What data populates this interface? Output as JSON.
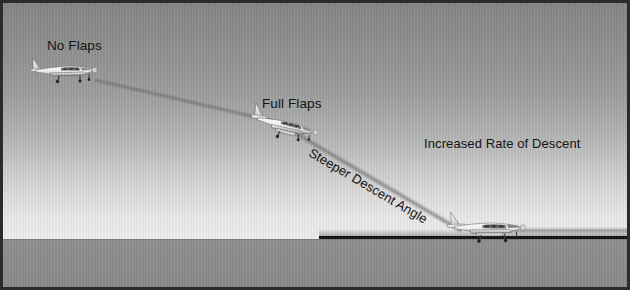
{
  "figure": {
    "kind": "aviation-diagram",
    "background": {
      "sky_top_color": "#868686",
      "sky_bottom_color": "#eeeeee",
      "ground_color": "#8e8e8e",
      "runway_line_color": "#14140f",
      "border_color": "#2b2b2b"
    }
  },
  "labels": {
    "no_flaps": "No Flaps",
    "full_flaps": "Full Flaps",
    "steeper_descent_angle": "Steeper Descent Angle",
    "increased_rate_of_descent": "Increased Rate of Descent"
  },
  "aircraft": [
    {
      "id": "no-flaps",
      "name": "airplane-no-flaps-icon",
      "x": 27,
      "y": 52,
      "attitude": "level",
      "label": "No Flaps"
    },
    {
      "id": "full-flaps",
      "name": "airplane-full-flaps-icon",
      "x": 248,
      "y": 104,
      "attitude": "nose-down-descending",
      "label": "Full Flaps"
    },
    {
      "id": "landing",
      "name": "airplane-landing-icon",
      "x": 444,
      "y": 206,
      "attitude": "touchdown",
      "label": ""
    }
  ],
  "paths": [
    {
      "id": "shallow-descent",
      "name": "shallow-descent-trail",
      "from": [
        92,
        74
      ],
      "to": [
        272,
        116
      ],
      "angle_deg": 13
    },
    {
      "id": "steep-descent",
      "name": "steep-descent-trail",
      "from": [
        288,
        124
      ],
      "to": [
        459,
        224
      ],
      "angle_deg": 30.5
    },
    {
      "id": "rollout",
      "name": "runway-rollout-trail",
      "from": [
        500,
        224
      ],
      "to": [
        624,
        224
      ],
      "angle_deg": 0
    }
  ]
}
